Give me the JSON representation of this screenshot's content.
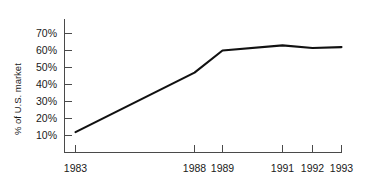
{
  "chart_data": {
    "type": "line",
    "title": "",
    "subtitle": "",
    "xlabel": "",
    "ylabel": "% of U.S. market",
    "x": [
      1983,
      1988,
      1989,
      1991,
      1992,
      1993
    ],
    "xtick_labels": [
      "1983",
      "1988",
      "1989",
      "1991",
      "1992",
      "1993"
    ],
    "values": [
      12,
      47,
      60,
      63,
      61.5,
      62
    ],
    "series": [
      {
        "name": "% of U.S. market",
        "values": [
          12,
          47,
          60,
          63,
          61.5,
          62
        ]
      }
    ],
    "ytick_labels": [
      "10%",
      "20%",
      "30%",
      "40%",
      "50%",
      "60%",
      "70%"
    ],
    "ytick_values": [
      10,
      20,
      30,
      40,
      50,
      60,
      70
    ],
    "xlim": [
      1983,
      1993
    ],
    "ylim": [
      6,
      76
    ],
    "grid": false,
    "legend": false,
    "legend_position": "none",
    "line_color": "#111111",
    "axis_color": "#4a4a4a",
    "background_color": "#ffffff",
    "annotations": []
  }
}
